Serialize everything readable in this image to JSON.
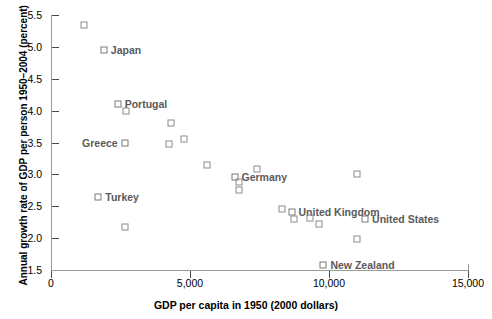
{
  "chart_data": {
    "type": "scatter",
    "title": "",
    "xlabel": "GDP per capita in 1950 (2000 dollars)",
    "ylabel": "Annual growth rate of GDP per person 1950–2004 (percent)",
    "xlim": [
      0,
      15000
    ],
    "ylim": [
      1.5,
      5.5
    ],
    "xticks": [
      0,
      5000,
      10000,
      15000
    ],
    "xtick_labels": [
      "0",
      "5,000",
      "10,000",
      "15,000"
    ],
    "yticks": [
      1.5,
      2.0,
      2.5,
      3.0,
      3.5,
      4.0,
      4.5,
      5.0,
      5.5
    ],
    "ytick_labels": [
      "1.5",
      "2.0",
      "2.5",
      "3.0",
      "3.5",
      "4.0",
      "4.5",
      "5.0",
      "5.5"
    ],
    "grid": false,
    "legend": null,
    "marker": "open-square",
    "marker_color": "#8c8c8c",
    "points": [
      {
        "label": "",
        "x": 1200,
        "y": 5.35,
        "label_pos": "none"
      },
      {
        "label": "Japan",
        "x": 1900,
        "y": 4.95,
        "label_pos": "right"
      },
      {
        "label": "Portugal",
        "x": 2400,
        "y": 4.1,
        "label_pos": "right"
      },
      {
        "label": "",
        "x": 2700,
        "y": 4.0,
        "label_pos": "none"
      },
      {
        "label": "",
        "x": 4300,
        "y": 3.8,
        "label_pos": "none"
      },
      {
        "label": "",
        "x": 4800,
        "y": 3.55,
        "label_pos": "none"
      },
      {
        "label": "Greece",
        "x": 2650,
        "y": 3.49,
        "label_pos": "left"
      },
      {
        "label": "",
        "x": 4250,
        "y": 3.47,
        "label_pos": "none"
      },
      {
        "label": "",
        "x": 5600,
        "y": 3.15,
        "label_pos": "none"
      },
      {
        "label": "Germany",
        "x": 6600,
        "y": 2.96,
        "label_pos": "right"
      },
      {
        "label": "",
        "x": 6750,
        "y": 2.88,
        "label_pos": "none"
      },
      {
        "label": "",
        "x": 6750,
        "y": 2.76,
        "label_pos": "none"
      },
      {
        "label": "",
        "x": 7400,
        "y": 3.08,
        "label_pos": "none"
      },
      {
        "label": "",
        "x": 11000,
        "y": 3.01,
        "label_pos": "none"
      },
      {
        "label": "Turkey",
        "x": 1700,
        "y": 2.65,
        "label_pos": "right"
      },
      {
        "label": "",
        "x": 8300,
        "y": 2.45,
        "label_pos": "none"
      },
      {
        "label": "United Kingdom",
        "x": 8650,
        "y": 2.41,
        "label_pos": "right"
      },
      {
        "label": "",
        "x": 8750,
        "y": 2.3,
        "label_pos": "none"
      },
      {
        "label": "",
        "x": 9300,
        "y": 2.32,
        "label_pos": "none"
      },
      {
        "label": "",
        "x": 9650,
        "y": 2.22,
        "label_pos": "none"
      },
      {
        "label": "United States",
        "x": 11300,
        "y": 2.3,
        "label_pos": "right"
      },
      {
        "label": "",
        "x": 2650,
        "y": 2.17,
        "label_pos": "none"
      },
      {
        "label": "",
        "x": 11000,
        "y": 1.99,
        "label_pos": "none"
      },
      {
        "label": "New Zealand",
        "x": 9800,
        "y": 1.58,
        "label_pos": "right"
      }
    ]
  }
}
